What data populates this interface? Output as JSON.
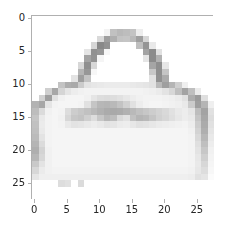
{
  "figure": {
    "width": 231,
    "height": 232,
    "background_color": "#ffffff",
    "axes_edge_color": "#b0b0b0",
    "tick_color": "#b0b0b0",
    "tick_label_color": "#262626"
  },
  "chart_data": {
    "type": "heatmap",
    "title": "",
    "xlabel": "",
    "ylabel": "",
    "colormap": "gray",
    "vmin": 0,
    "vmax": 255,
    "origin": "upper",
    "grid": false,
    "legend": "none",
    "colorbar": false,
    "extent": [
      -0.5,
      27.5,
      27.5,
      -0.5
    ],
    "xlim": [
      -0.5,
      27.5
    ],
    "ylim": [
      27.5,
      -0.5
    ],
    "xticks": [
      0,
      5,
      10,
      15,
      20,
      25
    ],
    "yticks": [
      0,
      5,
      10,
      15,
      20,
      25
    ],
    "xtick_labels": [
      "0",
      "5",
      "10",
      "15",
      "20",
      "25"
    ],
    "ytick_labels": [
      "0",
      "5",
      "10",
      "15",
      "20",
      "25"
    ],
    "shape": [
      28,
      28
    ],
    "values": [
      [
        0,
        0,
        0,
        0,
        0,
        0,
        0,
        0,
        0,
        0,
        0,
        0,
        0,
        0,
        0,
        0,
        0,
        0,
        0,
        0,
        0,
        0,
        0,
        0,
        0,
        0,
        0,
        0
      ],
      [
        0,
        0,
        0,
        0,
        0,
        0,
        0,
        0,
        0,
        0,
        0,
        0,
        0,
        0,
        0,
        0,
        0,
        0,
        0,
        0,
        0,
        0,
        0,
        0,
        0,
        0,
        0,
        0
      ],
      [
        0,
        0,
        0,
        0,
        0,
        0,
        0,
        0,
        0,
        0,
        0,
        12,
        62,
        70,
        66,
        60,
        18,
        0,
        0,
        0,
        0,
        0,
        0,
        0,
        0,
        0,
        0,
        0
      ],
      [
        0,
        0,
        0,
        0,
        0,
        0,
        0,
        0,
        0,
        0,
        38,
        96,
        80,
        60,
        58,
        70,
        96,
        40,
        0,
        0,
        0,
        0,
        0,
        0,
        0,
        0,
        0,
        0
      ],
      [
        0,
        0,
        0,
        0,
        0,
        0,
        0,
        0,
        0,
        40,
        118,
        108,
        0,
        0,
        0,
        0,
        64,
        106,
        22,
        0,
        0,
        0,
        0,
        0,
        0,
        0,
        0,
        0
      ],
      [
        0,
        0,
        0,
        0,
        0,
        0,
        0,
        0,
        26,
        110,
        104,
        8,
        0,
        0,
        0,
        0,
        0,
        92,
        116,
        30,
        0,
        0,
        0,
        0,
        0,
        0,
        0,
        0
      ],
      [
        0,
        0,
        0,
        0,
        0,
        0,
        0,
        0,
        92,
        108,
        10,
        0,
        0,
        0,
        0,
        0,
        0,
        26,
        116,
        78,
        0,
        0,
        0,
        0,
        0,
        0,
        0,
        0
      ],
      [
        0,
        0,
        0,
        0,
        0,
        0,
        0,
        40,
        112,
        40,
        0,
        0,
        0,
        0,
        0,
        0,
        0,
        0,
        90,
        112,
        24,
        0,
        0,
        0,
        0,
        0,
        0,
        0
      ],
      [
        0,
        0,
        0,
        0,
        0,
        0,
        0,
        74,
        104,
        8,
        0,
        0,
        0,
        0,
        0,
        0,
        0,
        0,
        56,
        112,
        58,
        0,
        0,
        0,
        0,
        0,
        0,
        0
      ],
      [
        0,
        0,
        0,
        0,
        0,
        0,
        28,
        96,
        60,
        0,
        0,
        0,
        0,
        0,
        0,
        0,
        0,
        0,
        30,
        110,
        84,
        0,
        0,
        0,
        0,
        0,
        0,
        0
      ],
      [
        0,
        0,
        0,
        0,
        60,
        82,
        86,
        52,
        28,
        24,
        22,
        20,
        20,
        20,
        20,
        22,
        24,
        26,
        30,
        70,
        96,
        74,
        48,
        16,
        0,
        0,
        0,
        0
      ],
      [
        0,
        0,
        48,
        88,
        42,
        26,
        18,
        14,
        12,
        12,
        12,
        12,
        12,
        12,
        12,
        12,
        12,
        14,
        16,
        20,
        28,
        40,
        64,
        92,
        64,
        20,
        0,
        0
      ],
      [
        0,
        46,
        96,
        30,
        14,
        10,
        10,
        10,
        14,
        26,
        34,
        36,
        34,
        30,
        24,
        18,
        14,
        12,
        12,
        12,
        14,
        16,
        20,
        30,
        82,
        100,
        32,
        0
      ],
      [
        76,
        88,
        26,
        12,
        10,
        10,
        10,
        12,
        30,
        58,
        72,
        74,
        70,
        60,
        46,
        30,
        18,
        12,
        10,
        10,
        12,
        14,
        16,
        22,
        52,
        96,
        74,
        16
      ],
      [
        66,
        36,
        14,
        10,
        12,
        34,
        50,
        56,
        62,
        70,
        78,
        84,
        86,
        84,
        78,
        70,
        62,
        56,
        50,
        44,
        38,
        30,
        22,
        18,
        26,
        66,
        92,
        30
      ],
      [
        58,
        22,
        12,
        10,
        14,
        40,
        56,
        60,
        48,
        34,
        56,
        72,
        66,
        38,
        30,
        62,
        74,
        70,
        58,
        46,
        40,
        32,
        24,
        18,
        22,
        58,
        88,
        34
      ],
      [
        62,
        20,
        12,
        10,
        12,
        22,
        28,
        26,
        22,
        18,
        22,
        28,
        26,
        20,
        18,
        24,
        30,
        28,
        24,
        20,
        18,
        16,
        14,
        12,
        18,
        50,
        84,
        30
      ],
      [
        64,
        22,
        12,
        10,
        10,
        10,
        10,
        10,
        10,
        10,
        10,
        10,
        10,
        10,
        10,
        10,
        10,
        10,
        10,
        10,
        10,
        10,
        10,
        10,
        14,
        44,
        80,
        26
      ],
      [
        68,
        28,
        12,
        10,
        10,
        10,
        10,
        10,
        10,
        10,
        10,
        10,
        10,
        10,
        10,
        10,
        10,
        10,
        10,
        10,
        10,
        10,
        10,
        10,
        12,
        38,
        72,
        22
      ],
      [
        74,
        36,
        12,
        10,
        10,
        10,
        10,
        10,
        10,
        10,
        10,
        10,
        10,
        10,
        10,
        10,
        10,
        10,
        10,
        10,
        10,
        10,
        10,
        10,
        12,
        32,
        64,
        18
      ],
      [
        80,
        44,
        14,
        10,
        10,
        10,
        10,
        10,
        10,
        10,
        10,
        10,
        10,
        10,
        10,
        10,
        10,
        10,
        10,
        10,
        10,
        10,
        10,
        10,
        12,
        28,
        56,
        14
      ],
      [
        72,
        40,
        14,
        10,
        10,
        10,
        10,
        10,
        10,
        10,
        10,
        10,
        10,
        10,
        10,
        10,
        10,
        10,
        10,
        10,
        10,
        10,
        10,
        10,
        12,
        24,
        48,
        12
      ],
      [
        54,
        28,
        14,
        10,
        10,
        10,
        10,
        10,
        10,
        10,
        10,
        10,
        10,
        10,
        10,
        10,
        10,
        10,
        10,
        10,
        10,
        10,
        10,
        10,
        12,
        22,
        40,
        10
      ],
      [
        40,
        20,
        14,
        12,
        12,
        12,
        12,
        12,
        12,
        12,
        12,
        12,
        12,
        12,
        12,
        12,
        12,
        12,
        12,
        12,
        12,
        12,
        12,
        12,
        14,
        24,
        34,
        8
      ],
      [
        26,
        16,
        16,
        16,
        16,
        16,
        16,
        16,
        16,
        16,
        16,
        16,
        16,
        16,
        16,
        16,
        16,
        16,
        16,
        16,
        16,
        16,
        16,
        16,
        18,
        30,
        26,
        4
      ],
      [
        0,
        0,
        0,
        0,
        34,
        30,
        0,
        36,
        0,
        0,
        0,
        0,
        0,
        0,
        0,
        0,
        0,
        0,
        0,
        0,
        0,
        0,
        0,
        0,
        0,
        0,
        0,
        0
      ],
      [
        0,
        0,
        0,
        0,
        0,
        0,
        0,
        0,
        0,
        0,
        0,
        0,
        0,
        0,
        0,
        0,
        0,
        0,
        0,
        0,
        0,
        0,
        0,
        0,
        0,
        0,
        0,
        0
      ],
      [
        0,
        0,
        0,
        0,
        0,
        0,
        0,
        0,
        0,
        0,
        0,
        0,
        0,
        0,
        0,
        0,
        0,
        0,
        0,
        0,
        0,
        0,
        0,
        0,
        0,
        0,
        0,
        0
      ]
    ]
  }
}
